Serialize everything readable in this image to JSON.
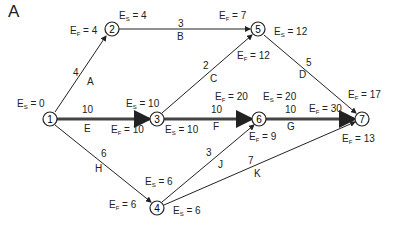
{
  "figure": {
    "panel_label": "A",
    "nodes": [
      {
        "id": "1",
        "x": 50,
        "y": 119
      },
      {
        "id": "2",
        "x": 112,
        "y": 29
      },
      {
        "id": "3",
        "x": 157,
        "y": 119
      },
      {
        "id": "4",
        "x": 157,
        "y": 208
      },
      {
        "id": "5",
        "x": 258,
        "y": 29
      },
      {
        "id": "6",
        "x": 259,
        "y": 119
      },
      {
        "id": "7",
        "x": 362,
        "y": 119
      }
    ],
    "activities": [
      {
        "name": "A",
        "duration": "4",
        "from": "1",
        "to": "2",
        "critical": false
      },
      {
        "name": "B",
        "duration": "3",
        "from": "2",
        "to": "5",
        "critical": false
      },
      {
        "name": "C",
        "duration": "2",
        "from": "3",
        "to": "5",
        "critical": false
      },
      {
        "name": "D",
        "duration": "5",
        "from": "5",
        "to": "7",
        "critical": false
      },
      {
        "name": "E",
        "duration": "10",
        "from": "1",
        "to": "3",
        "critical": true
      },
      {
        "name": "F",
        "duration": "10",
        "from": "3",
        "to": "6",
        "critical": true
      },
      {
        "name": "G",
        "duration": "10",
        "from": "6",
        "to": "7",
        "critical": true
      },
      {
        "name": "H",
        "duration": "6",
        "from": "1",
        "to": "4",
        "critical": false
      },
      {
        "name": "J",
        "duration": "3",
        "from": "4",
        "to": "6",
        "critical": false
      },
      {
        "name": "K",
        "duration": "7",
        "from": "4",
        "to": "7",
        "critical": false
      }
    ],
    "times": {
      "es_1": "0",
      "ef_2": "4",
      "es_2": "4",
      "ef_5": "7",
      "es_5": "12",
      "ef_5c": "12",
      "es_3": "10",
      "ef_3": "10",
      "es_3b": "10",
      "ef_6": "20",
      "es_6": "20",
      "ef_7": "30",
      "ef_7d": "17",
      "ef_6j": "9",
      "ef_7k": "13",
      "es_4a": "6",
      "ef_4": "6",
      "es_4b": "6"
    },
    "symbols": {
      "es": "E",
      "es_sub": "S",
      "ef": "E",
      "ef_sub": "F",
      "eq": " = "
    }
  }
}
